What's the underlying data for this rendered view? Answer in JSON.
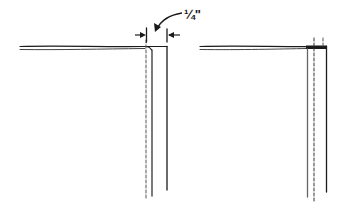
{
  "diagram": {
    "dimension_label": "1/4\"",
    "dimension_label_display": "¼\"",
    "colors": {
      "ink": "#1a1a1a",
      "gray_ink": "#555555",
      "background": "#ffffff"
    },
    "figures": [
      {
        "id": "left",
        "description": "Fabric edge with 1/4 inch allowance marked before folding",
        "elements": [
          "horizontal double fabric line",
          "dashed stitch line",
          "inner solid edge",
          "outer solid edge",
          "dimension arrows",
          "curved pointer arrow"
        ]
      },
      {
        "id": "right",
        "description": "Fabric edge after folding with allowance pressed",
        "elements": [
          "horizontal double fabric line",
          "solid edge",
          "dashed stitch line",
          "dashed short tick",
          "outer solid edge"
        ]
      }
    ]
  }
}
